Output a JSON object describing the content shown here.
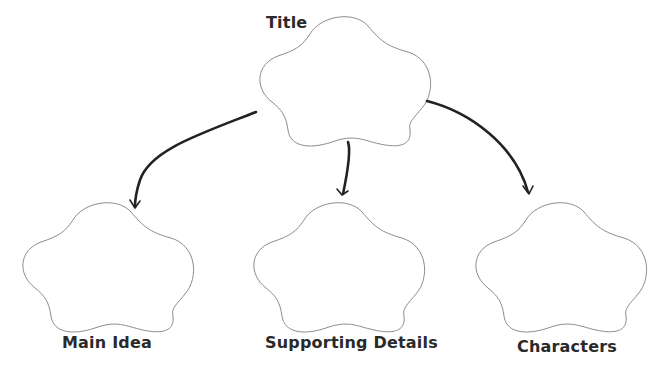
{
  "diagram": {
    "type": "graphic-organizer",
    "nodes": {
      "title": {
        "label": "Title"
      },
      "main_idea": {
        "label": "Main Idea"
      },
      "supporting_details": {
        "label": "Supporting Details"
      },
      "characters": {
        "label": "Characters"
      }
    },
    "edges": [
      {
        "from": "title",
        "to": "main_idea"
      },
      {
        "from": "title",
        "to": "supporting_details"
      },
      {
        "from": "title",
        "to": "characters"
      }
    ],
    "colors": {
      "outline": "#8c8c8c",
      "arrow": "#222222",
      "text": "#2a2a2a",
      "background": "#ffffff"
    }
  }
}
